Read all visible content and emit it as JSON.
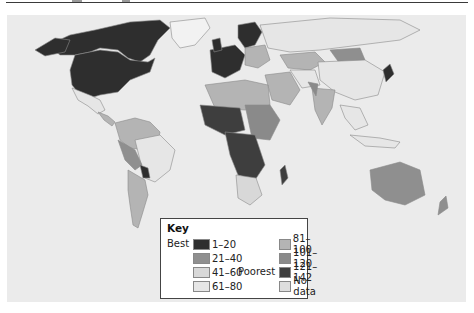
{
  "map": {
    "background": "#ebebeb",
    "ocean_color": "#ebebeb",
    "border_color": "#8a8a8a"
  },
  "legend": {
    "title": "Key",
    "best_label": "Best",
    "poorest_label": "Poorest",
    "items": [
      {
        "label": "1–20",
        "color": "#2e2e2e"
      },
      {
        "label": "21–40",
        "color": "#8f8f8f"
      },
      {
        "label": "41–60",
        "color": "#d8d8d8"
      },
      {
        "label": "61–80",
        "color": "#e6e6e6"
      },
      {
        "label": "81–100",
        "color": "#b4b4b4"
      },
      {
        "label": "101–120",
        "color": "#8a8a8a"
      },
      {
        "label": "121–142",
        "color": "#3e3e3e"
      },
      {
        "label": "No data",
        "color": "#dedede"
      }
    ]
  }
}
